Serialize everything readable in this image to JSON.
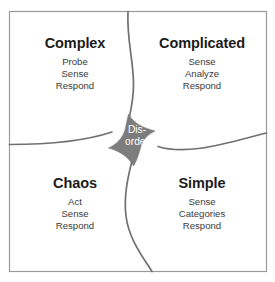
{
  "diagram": {
    "name": "cynefin-framework",
    "background_color": "#ffffff",
    "border_color": "#9a9a9a",
    "curve_color": "#707070",
    "center_fill": "#7d7d7d",
    "title_color": "#1b1b1b",
    "body_color": "#3a3a3a",
    "center_text_color": "#ffffff"
  },
  "quadrants": {
    "complex": {
      "title": "Complex",
      "lines": [
        "Probe",
        "Sense",
        "Respond"
      ]
    },
    "complicated": {
      "title": "Complicated",
      "lines": [
        "Sense",
        "Analyze",
        "Respond"
      ]
    },
    "chaos": {
      "title": "Chaos",
      "lines": [
        "Act",
        "Sense",
        "Respond"
      ]
    },
    "simple": {
      "title": "Simple",
      "lines": [
        "Sense",
        "Categories",
        "Respond"
      ]
    }
  },
  "center": {
    "label_line_1": "Dis-",
    "label_line_2": "order"
  }
}
